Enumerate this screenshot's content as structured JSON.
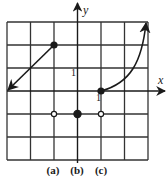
{
  "graph": {
    "x_range": [
      -3,
      3
    ],
    "y_range": [
      -3,
      3
    ],
    "axis_labels": {
      "x": "x",
      "y": "y"
    },
    "tick_labels": {
      "y_one": "1",
      "x_one": "1"
    },
    "parts": [
      {
        "label": "(a)",
        "x": -1
      },
      {
        "label": "(b)",
        "x": 0
      },
      {
        "label": "(c)",
        "x": 1
      }
    ],
    "line_a": {
      "closed_point": [
        -1,
        2
      ],
      "arrow_to": [
        -3,
        0
      ]
    },
    "curve_c": {
      "closed_point": [
        1,
        0
      ],
      "arrow_to": [
        3,
        3
      ]
    },
    "points": [
      {
        "name": "point-a-open",
        "x": -1,
        "y": -1,
        "filled": false
      },
      {
        "name": "point-b-closed",
        "x": 0,
        "y": -1,
        "filled": true
      },
      {
        "name": "point-c-open",
        "x": 1,
        "y": -1,
        "filled": false
      }
    ],
    "colors": {
      "ink": "#1a1a1a",
      "grid": "#333333"
    }
  }
}
